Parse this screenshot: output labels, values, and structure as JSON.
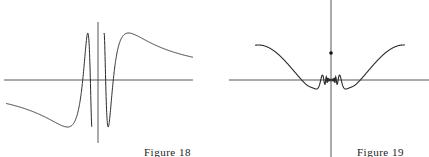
{
  "figures": [
    {
      "id": "figure-18",
      "caption": "Figure 18",
      "description": "Graph of sin(1/x): oscillations accumulate near the origin between -1 and 1",
      "axes": {
        "x_axis": true,
        "y_axis": true
      }
    },
    {
      "id": "figure-19",
      "caption": "Figure 19",
      "description": "Graph of x^2 sin(1/x) type function with small oscillations near origin and an isolated point on the y-axis",
      "axes": {
        "x_axis": true,
        "y_axis": true
      },
      "isolated_point": "on y-axis above origin"
    }
  ],
  "colors": {
    "curve": "#2a2a2a",
    "axis": "#444444",
    "background": "#ffffff"
  }
}
